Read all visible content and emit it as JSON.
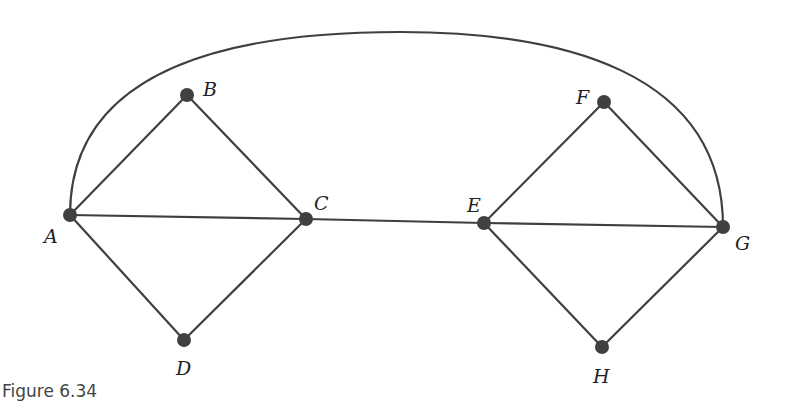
{
  "figure": {
    "caption": "Figure 6.34",
    "nodes": [
      {
        "id": "A",
        "label": "A"
      },
      {
        "id": "B",
        "label": "B"
      },
      {
        "id": "C",
        "label": "C"
      },
      {
        "id": "D",
        "label": "D"
      },
      {
        "id": "E",
        "label": "E"
      },
      {
        "id": "F",
        "label": "F"
      },
      {
        "id": "G",
        "label": "G"
      },
      {
        "id": "H",
        "label": "H"
      }
    ],
    "edges": [
      [
        "A",
        "B"
      ],
      [
        "B",
        "C"
      ],
      [
        "A",
        "C"
      ],
      [
        "A",
        "D"
      ],
      [
        "D",
        "C"
      ],
      [
        "C",
        "E"
      ],
      [
        "E",
        "F"
      ],
      [
        "F",
        "G"
      ],
      [
        "E",
        "G"
      ],
      [
        "E",
        "H"
      ],
      [
        "H",
        "G"
      ],
      [
        "A",
        "G"
      ]
    ],
    "colors": {
      "edge": "#3f3f3f",
      "node": "#404040",
      "background": "#ffffff"
    }
  }
}
